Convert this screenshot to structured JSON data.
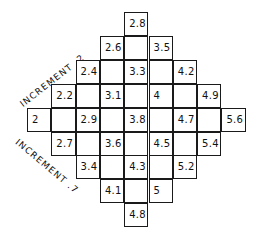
{
  "diagram": {
    "labels": {
      "upper_diagonal": "INCREMENT .2",
      "lower_diagonal": "INCREMENT .7"
    },
    "grid": {
      "columns": 9,
      "rows": 9,
      "cells": [
        {
          "row": 0,
          "col": 4,
          "value": "2.8"
        },
        {
          "row": 1,
          "col": 3,
          "value": "2.6"
        },
        {
          "row": 1,
          "col": 4,
          "value": ""
        },
        {
          "row": 1,
          "col": 5,
          "value": "3.5"
        },
        {
          "row": 2,
          "col": 2,
          "value": "2.4"
        },
        {
          "row": 2,
          "col": 3,
          "value": ""
        },
        {
          "row": 2,
          "col": 4,
          "value": "3.3"
        },
        {
          "row": 2,
          "col": 5,
          "value": ""
        },
        {
          "row": 2,
          "col": 6,
          "value": "4.2"
        },
        {
          "row": 3,
          "col": 1,
          "value": "2.2"
        },
        {
          "row": 3,
          "col": 2,
          "value": ""
        },
        {
          "row": 3,
          "col": 3,
          "value": "3.1"
        },
        {
          "row": 3,
          "col": 4,
          "value": ""
        },
        {
          "row": 3,
          "col": 5,
          "value": "4"
        },
        {
          "row": 3,
          "col": 6,
          "value": ""
        },
        {
          "row": 3,
          "col": 7,
          "value": "4.9"
        },
        {
          "row": 4,
          "col": 0,
          "value": "2"
        },
        {
          "row": 4,
          "col": 1,
          "value": ""
        },
        {
          "row": 4,
          "col": 2,
          "value": "2.9"
        },
        {
          "row": 4,
          "col": 3,
          "value": ""
        },
        {
          "row": 4,
          "col": 4,
          "value": "3.8"
        },
        {
          "row": 4,
          "col": 5,
          "value": ""
        },
        {
          "row": 4,
          "col": 6,
          "value": "4.7"
        },
        {
          "row": 4,
          "col": 7,
          "value": ""
        },
        {
          "row": 4,
          "col": 8,
          "value": "5.6"
        },
        {
          "row": 5,
          "col": 1,
          "value": "2.7"
        },
        {
          "row": 5,
          "col": 2,
          "value": ""
        },
        {
          "row": 5,
          "col": 3,
          "value": "3.6"
        },
        {
          "row": 5,
          "col": 4,
          "value": ""
        },
        {
          "row": 5,
          "col": 5,
          "value": "4.5"
        },
        {
          "row": 5,
          "col": 6,
          "value": ""
        },
        {
          "row": 5,
          "col": 7,
          "value": "5.4"
        },
        {
          "row": 6,
          "col": 2,
          "value": "3.4"
        },
        {
          "row": 6,
          "col": 3,
          "value": ""
        },
        {
          "row": 6,
          "col": 4,
          "value": "4.3"
        },
        {
          "row": 6,
          "col": 5,
          "value": ""
        },
        {
          "row": 6,
          "col": 6,
          "value": "5.2"
        },
        {
          "row": 7,
          "col": 3,
          "value": "4.1"
        },
        {
          "row": 7,
          "col": 4,
          "value": ""
        },
        {
          "row": 7,
          "col": 5,
          "value": "5"
        },
        {
          "row": 8,
          "col": 4,
          "value": "4.8"
        }
      ]
    }
  }
}
